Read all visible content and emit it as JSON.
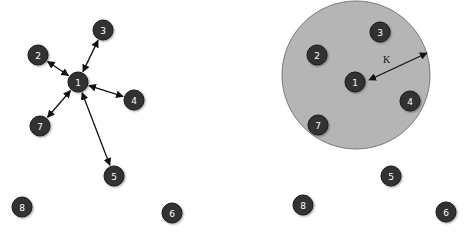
{
  "diagram": {
    "colors": {
      "node_fill": "#333333",
      "node_stroke": "#1a1a1a",
      "node_text": "#ffffff",
      "edge": "#111111",
      "neighborhood_fill": "#b5b5b5",
      "neighborhood_stroke": "#777777"
    },
    "left_panel": {
      "title": "",
      "nodes": [
        {
          "id": "1",
          "label": "1",
          "x": 78,
          "y": 82
        },
        {
          "id": "2",
          "label": "2",
          "x": 38,
          "y": 55
        },
        {
          "id": "3",
          "label": "3",
          "x": 103,
          "y": 30
        },
        {
          "id": "4",
          "label": "4",
          "x": 134,
          "y": 100
        },
        {
          "id": "5",
          "label": "5",
          "x": 114,
          "y": 176
        },
        {
          "id": "6",
          "label": "6",
          "x": 172,
          "y": 213
        },
        {
          "id": "7",
          "label": "7",
          "x": 40,
          "y": 126
        },
        {
          "id": "8",
          "label": "8",
          "x": 22,
          "y": 207
        }
      ],
      "edges": [
        {
          "from": "1",
          "to": "2",
          "bidirectional": true
        },
        {
          "from": "1",
          "to": "3",
          "bidirectional": true
        },
        {
          "from": "1",
          "to": "4",
          "bidirectional": true
        },
        {
          "from": "1",
          "to": "7",
          "bidirectional": true
        },
        {
          "from": "1",
          "to": "5",
          "bidirectional": true
        }
      ]
    },
    "right_panel": {
      "neighborhood": {
        "cx": 356,
        "cy": 75,
        "r": 74
      },
      "radius_label": "K",
      "radius_arrow": {
        "x1": 369,
        "y1": 80,
        "x2": 427,
        "y2": 53
      },
      "nodes": [
        {
          "id": "1",
          "label": "1",
          "x": 355,
          "y": 82
        },
        {
          "id": "2",
          "label": "2",
          "x": 317,
          "y": 55
        },
        {
          "id": "3",
          "label": "3",
          "x": 380,
          "y": 32
        },
        {
          "id": "4",
          "label": "4",
          "x": 410,
          "y": 101
        },
        {
          "id": "5",
          "label": "5",
          "x": 391,
          "y": 176
        },
        {
          "id": "6",
          "label": "6",
          "x": 446,
          "y": 212
        },
        {
          "id": "7",
          "label": "7",
          "x": 318,
          "y": 125
        },
        {
          "id": "8",
          "label": "8",
          "x": 303,
          "y": 205
        }
      ]
    }
  }
}
